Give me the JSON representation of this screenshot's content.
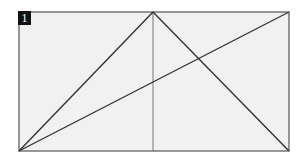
{
  "figure": {
    "label": "1",
    "background": "#f1f1f1",
    "stroke": "#333333",
    "frame": {
      "x1": 19,
      "y1": 12,
      "x2": 289,
      "y2": 151
    },
    "lines": [
      {
        "name": "left-diagonal",
        "x1": 19,
        "y1": 151,
        "x2": 153,
        "y2": 12
      },
      {
        "name": "right-diagonal",
        "x1": 153,
        "y1": 12,
        "x2": 289,
        "y2": 151
      },
      {
        "name": "long-diagonal",
        "x1": 19,
        "y1": 151,
        "x2": 289,
        "y2": 12
      },
      {
        "name": "vertical-median",
        "x1": 153,
        "y1": 12,
        "x2": 153,
        "y2": 151
      }
    ]
  }
}
